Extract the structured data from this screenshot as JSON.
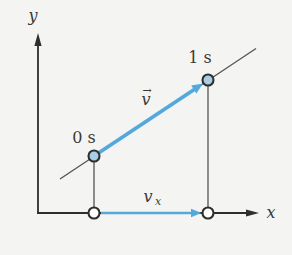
{
  "diagram": {
    "labels": {
      "y_axis": "y",
      "x_axis": "x",
      "point_start": "0 s",
      "point_end": "1 s",
      "vector_v_base": "v",
      "vector_v_accent": "→",
      "vector_vx_base": "v",
      "vector_vx_subscript": "x"
    },
    "points": [
      {
        "name": "position-at-0s",
        "label": "0 s",
        "px": 94,
        "py": 156,
        "style": "filled-blue"
      },
      {
        "name": "position-at-1s",
        "label": "1 s",
        "px": 208,
        "py": 80,
        "style": "filled-blue"
      },
      {
        "name": "x-projection-of-0s",
        "px": 94,
        "py": 213,
        "style": "open-white"
      },
      {
        "name": "x-projection-of-1s",
        "px": 208,
        "py": 213,
        "style": "open-white"
      }
    ],
    "colors": {
      "vector_blue": "#55a8dc",
      "point_fill_blue": "#a8cde6",
      "point_fill_open": "#ffffff",
      "axis_dark": "#2e2e2a",
      "trajectory_gray": "#55544e",
      "background": "#f4f4f2"
    }
  }
}
